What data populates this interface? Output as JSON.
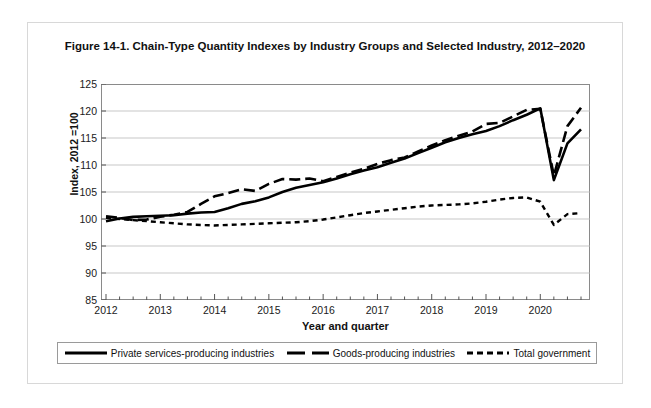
{
  "figure": {
    "title": "Figure 14-1. Chain-Type Quantity Indexes by Industry Groups and Selected Industry, 2012–2020"
  },
  "axes": {
    "ylabel": "Index, 2012 =100",
    "xlabel": "Year and quarter",
    "yticks": [
      "85",
      "90",
      "95",
      "100",
      "105",
      "110",
      "115",
      "120",
      "125"
    ],
    "xticks": [
      "2012",
      "2013",
      "2014",
      "2015",
      "2016",
      "2017",
      "2018",
      "2019",
      "2020"
    ]
  },
  "legend": [
    {
      "label": "Private services-producing industries",
      "style": "solid",
      "color": "#000000"
    },
    {
      "label": "Goods-producing industries",
      "style": "long-dash",
      "color": "#000000"
    },
    {
      "label": "Total government",
      "style": "short-dash",
      "color": "#000000"
    }
  ],
  "chart_data": {
    "type": "line",
    "title": "Figure 14-1. Chain-Type Quantity Indexes by Industry Groups and Selected Industry, 2012–2020",
    "xlabel": "Year and quarter",
    "ylabel": "Index, 2012 =100",
    "ylim": [
      85,
      125
    ],
    "ytick_step": 5,
    "xlim": [
      "2012 Q1",
      "2020 Q4"
    ],
    "grid": "horizontal",
    "legend_position": "below-plot",
    "x": [
      "2012 Q1",
      "2012 Q2",
      "2012 Q3",
      "2012 Q4",
      "2013 Q1",
      "2013 Q2",
      "2013 Q3",
      "2013 Q4",
      "2014 Q1",
      "2014 Q2",
      "2014 Q3",
      "2014 Q4",
      "2015 Q1",
      "2015 Q2",
      "2015 Q3",
      "2015 Q4",
      "2016 Q1",
      "2016 Q2",
      "2016 Q3",
      "2016 Q4",
      "2017 Q1",
      "2017 Q2",
      "2017 Q3",
      "2017 Q4",
      "2018 Q1",
      "2018 Q2",
      "2018 Q3",
      "2018 Q4",
      "2019 Q1",
      "2019 Q2",
      "2019 Q3",
      "2019 Q4",
      "2020 Q1",
      "2020 Q2",
      "2020 Q3",
      "2020 Q4"
    ],
    "series": [
      {
        "name": "Private services-producing industries",
        "style": "solid",
        "values": [
          99.6,
          100.1,
          100.4,
          100.5,
          100.6,
          100.7,
          101.0,
          101.2,
          101.3,
          102.0,
          102.8,
          103.3,
          104.0,
          105.0,
          105.8,
          106.3,
          106.8,
          107.5,
          108.3,
          109.0,
          109.6,
          110.4,
          111.2,
          112.2,
          113.2,
          114.2,
          115.0,
          115.7,
          116.3,
          117.2,
          118.3,
          119.3,
          120.5,
          107.2,
          114.0,
          116.6
        ]
      },
      {
        "name": "Goods-producing industries",
        "style": "long-dash",
        "values": [
          100.5,
          100.2,
          99.8,
          99.9,
          100.4,
          100.8,
          101.3,
          102.8,
          104.2,
          104.8,
          105.5,
          105.2,
          106.5,
          107.4,
          107.3,
          107.5,
          107.0,
          107.8,
          108.6,
          109.3,
          110.2,
          110.9,
          111.4,
          112.5,
          113.6,
          114.6,
          115.4,
          116.2,
          117.6,
          117.8,
          119.0,
          120.2,
          120.4,
          108.0,
          117.2,
          120.6
        ]
      },
      {
        "name": "Total government",
        "style": "short-dash",
        "values": [
          100.2,
          100.0,
          99.8,
          99.6,
          99.4,
          99.2,
          99.0,
          98.9,
          98.8,
          98.9,
          99.0,
          99.1,
          99.2,
          99.3,
          99.4,
          99.6,
          99.9,
          100.3,
          100.7,
          101.1,
          101.4,
          101.7,
          102.0,
          102.3,
          102.5,
          102.6,
          102.7,
          102.9,
          103.2,
          103.6,
          103.9,
          104.0,
          103.2,
          98.9,
          100.9,
          101.1
        ]
      }
    ]
  }
}
